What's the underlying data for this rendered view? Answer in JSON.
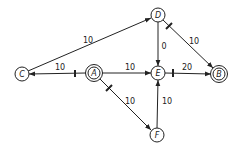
{
  "diagram": {
    "type": "directed-graph",
    "nodes": [
      {
        "id": "D",
        "label": "D",
        "x": 158,
        "y": 15,
        "double": false
      },
      {
        "id": "C",
        "label": "C",
        "x": 22,
        "y": 74,
        "double": false
      },
      {
        "id": "A",
        "label": "A",
        "x": 94,
        "y": 73,
        "double": true
      },
      {
        "id": "E",
        "label": "E",
        "x": 158,
        "y": 73,
        "double": false
      },
      {
        "id": "B",
        "label": "B",
        "x": 219,
        "y": 74,
        "double": true
      },
      {
        "id": "F",
        "label": "F",
        "x": 157,
        "y": 135,
        "double": false
      }
    ],
    "edges": [
      {
        "from": "C",
        "to": "D",
        "weight": "10",
        "tick": false
      },
      {
        "from": "A",
        "to": "C",
        "weight": "10",
        "tick": true
      },
      {
        "from": "A",
        "to": "E",
        "weight": "10",
        "tick": false
      },
      {
        "from": "E",
        "to": "B",
        "weight": "20",
        "tick": true
      },
      {
        "from": "D",
        "to": "E",
        "weight": "0",
        "tick": false
      },
      {
        "from": "D",
        "to": "B",
        "weight": "10",
        "tick": true
      },
      {
        "from": "A",
        "to": "F",
        "weight": "10",
        "tick": true
      },
      {
        "from": "F",
        "to": "E",
        "weight": "10",
        "tick": false
      }
    ]
  }
}
